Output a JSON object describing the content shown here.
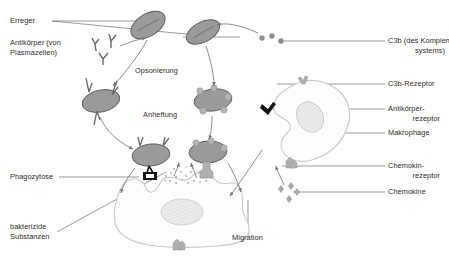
{
  "diagram": {
    "language": "de",
    "colors": {
      "background": "#ffffff",
      "text": "#2b2b2b",
      "leader_line": "#6f6f6f",
      "pathogen_fill": "#9a9a9a",
      "pathogen_stroke": "#5a5a5a",
      "macrophage_stroke": "#c8c8c8",
      "macrophage_fill": "#fdfdfd",
      "nucleus_fill": "#e6e6e6",
      "receptor_gray": "#b0b0b0",
      "receptor_black": "#151515",
      "c3b_dot": "#8f8f8f",
      "chemokine": "#a8a8a8",
      "arrow": "#777777"
    },
    "labels": {
      "erreger": "Erreger",
      "antikoerper_1": "Antikörper (von",
      "antikoerper_2": "Plasmazellen)",
      "opsonierung": "Opsonierung",
      "anheftung": "Anheftung",
      "phagozytose": "Phagozytose",
      "bakterizide_1": "bakterizide",
      "bakterizide_2": "Substanzen",
      "migration": "Migration",
      "c3b_1": "C3b (des Komplement-",
      "c3b_2": "systems)",
      "c3b_rezeptor": "C3b-Rezeptor",
      "ak_rezeptor_1": "Antikörper-",
      "ak_rezeptor_2": "rezeptor",
      "makrophage": "Makrophage",
      "chemokin_rezeptor_1": "Chemokin-",
      "chemokin_rezeptor_2": "rezeptor",
      "chemokine": "Chemokine"
    },
    "elements": {
      "pathogens": 6,
      "antibodies_free": 3,
      "c3b_dots": 3,
      "chemokine_particles": 4,
      "macrophages": 2
    }
  }
}
